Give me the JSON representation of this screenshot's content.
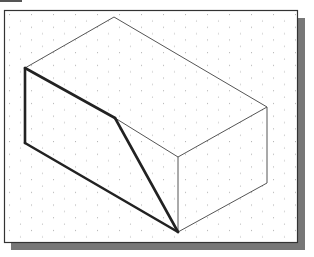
{
  "figure": {
    "colors": {
      "background": "#ffffff",
      "frame_border": "#333333",
      "shadow": "#777777",
      "grid_dot": "#b5b5b5",
      "thin_line": "#555555",
      "bold_line": "#222222"
    },
    "frame": {
      "x": 4,
      "y": 10,
      "width": 294,
      "height": 233,
      "shadow_offset": 7
    },
    "tab": {
      "x1": 0,
      "x2": 22,
      "y": 1
    },
    "vertices": {
      "A_left_top": [
        25,
        68
      ],
      "B_left_bottom": [
        25,
        143
      ],
      "C_top_apex": [
        114,
        17
      ],
      "D_right_top": [
        267,
        107
      ],
      "E_right_bottom": [
        267,
        183
      ],
      "F_front_top_right": [
        178,
        157
      ],
      "G_front_bottom": [
        178,
        232
      ],
      "H_cut_point": [
        115,
        118
      ]
    },
    "thin_edges": [
      [
        "A_left_top",
        "C_top_apex"
      ],
      [
        "C_top_apex",
        "D_right_top"
      ],
      [
        "D_right_top",
        "F_front_top_right"
      ],
      [
        "F_front_top_right",
        "H_cut_point"
      ],
      [
        "D_right_top",
        "E_right_bottom"
      ],
      [
        "E_right_bottom",
        "G_front_bottom"
      ],
      [
        "F_front_top_right",
        "G_front_bottom"
      ]
    ],
    "bold_edges": [
      [
        "A_left_top",
        "B_left_bottom"
      ],
      [
        "B_left_bottom",
        "G_front_bottom"
      ],
      [
        "A_left_top",
        "H_cut_point"
      ],
      [
        "H_cut_point",
        "G_front_bottom"
      ]
    ]
  }
}
